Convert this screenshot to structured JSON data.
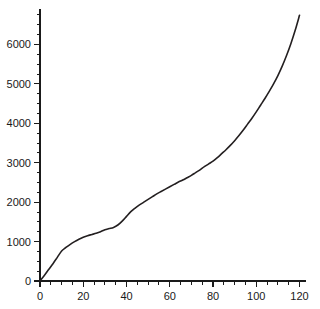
{
  "chart_data": {
    "type": "line",
    "title": "",
    "subtitle": "",
    "xlabel": "",
    "ylabel": "",
    "xlim": [
      0,
      123
    ],
    "ylim": [
      0,
      6900
    ],
    "grid": false,
    "legend": null,
    "x_ticks_major": [
      0,
      20,
      40,
      60,
      80,
      100,
      120
    ],
    "x_tick_labels": [
      "0",
      "20",
      "40",
      "60",
      "80",
      "100",
      "120"
    ],
    "x_minor_step": 5,
    "y_ticks_major": [
      0,
      1000,
      2000,
      3000,
      4000,
      5000,
      6000
    ],
    "y_tick_labels": [
      "0",
      "1000",
      "2000",
      "3000",
      "4000",
      "5000",
      "6000"
    ],
    "y_minor_step": 250,
    "series": [
      {
        "name": "curve",
        "color": "#231f20",
        "x": [
          0,
          2,
          4,
          6,
          8,
          10,
          12,
          14,
          16,
          18,
          20,
          22,
          24,
          26,
          28,
          30,
          32,
          34,
          36,
          38,
          40,
          42,
          44,
          46,
          48,
          50,
          52,
          54,
          56,
          58,
          60,
          62,
          64,
          66,
          68,
          70,
          72,
          74,
          76,
          78,
          80,
          82,
          84,
          86,
          88,
          90,
          92,
          94,
          96,
          98,
          100,
          102,
          104,
          106,
          108,
          110,
          112,
          114,
          116,
          118,
          120
        ],
        "values": [
          0,
          140,
          290,
          440,
          600,
          760,
          850,
          930,
          1000,
          1060,
          1110,
          1150,
          1180,
          1210,
          1250,
          1300,
          1330,
          1360,
          1420,
          1520,
          1640,
          1760,
          1850,
          1930,
          2000,
          2070,
          2140,
          2210,
          2270,
          2330,
          2390,
          2450,
          2510,
          2560,
          2620,
          2680,
          2750,
          2820,
          2900,
          2970,
          3040,
          3130,
          3230,
          3330,
          3440,
          3560,
          3690,
          3830,
          3980,
          4130,
          4290,
          4460,
          4630,
          4810,
          5000,
          5210,
          5450,
          5720,
          6020,
          6360,
          6740
        ]
      }
    ]
  },
  "axes": {
    "x_axis_name": "x-axis",
    "y_axis_name": "y-axis"
  }
}
